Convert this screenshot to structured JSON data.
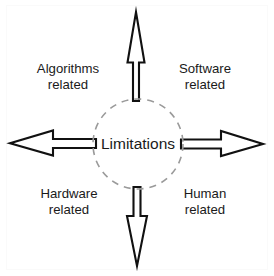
{
  "diagram": {
    "type": "radial-arrow-concept-diagram",
    "title_visible": false,
    "background_color": "#ffffff",
    "outline_color": "#111111",
    "hub": {
      "label": "Limitations",
      "shape": "dashed-circle",
      "stroke_color": "#9a9a9a",
      "fill_color": "#ffffff",
      "center_x": 138,
      "center_y": 144,
      "radius": 45
    },
    "arrows": [
      {
        "id": "arrow-up",
        "direction": "up",
        "tip_x": 136,
        "tip_y": 12,
        "style": "hollow-outline"
      },
      {
        "id": "arrow-right",
        "direction": "right",
        "tip_x": 263,
        "tip_y": 144,
        "style": "hollow-outline"
      },
      {
        "id": "arrow-down",
        "direction": "down",
        "tip_x": 137,
        "tip_y": 266,
        "style": "hollow-outline"
      },
      {
        "id": "arrow-left",
        "direction": "left",
        "tip_x": 10,
        "tip_y": 143,
        "style": "hollow-outline"
      }
    ],
    "labels": [
      {
        "id": "algorithms",
        "quadrant": "top-left",
        "line1": "Algorithms",
        "line2": "related"
      },
      {
        "id": "software",
        "quadrant": "top-right",
        "line1": "Software",
        "line2": "related"
      },
      {
        "id": "hardware",
        "quadrant": "bottom-left",
        "line1": "Hardware",
        "line2": "related"
      },
      {
        "id": "human",
        "quadrant": "bottom-right",
        "line1": "Human",
        "line2": "related"
      }
    ]
  }
}
